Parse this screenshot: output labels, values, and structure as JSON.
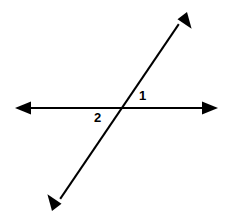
{
  "figure": {
    "background_color": "#ffffff",
    "stroke_color": "#000000",
    "width": 228,
    "height": 222
  },
  "labels": {
    "angle_1": "1",
    "angle_2": "2"
  },
  "geometry": {
    "intersection": {
      "x": 121,
      "y": 108
    },
    "lines": [
      {
        "name": "horizontal-line",
        "from": {
          "x": 15,
          "y": 108
        },
        "to": {
          "x": 218,
          "y": 108
        },
        "arrowheads": "both",
        "stroke_width": 2
      },
      {
        "name": "diagonal-line",
        "from": {
          "x": 52,
          "y": 211
        },
        "to": {
          "x": 187,
          "y": 12
        },
        "arrowheads": "both",
        "stroke_width": 2
      }
    ]
  }
}
